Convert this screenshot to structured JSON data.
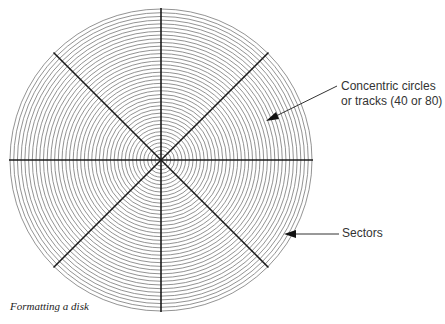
{
  "diagram": {
    "title": "Formatting a disk",
    "disk": {
      "center": [
        161,
        160
      ],
      "outer_radius": 151,
      "inner_radius": 6,
      "track_count": 40,
      "sector_lines": 8,
      "track_color": "#777777",
      "sector_color": "#1a1a1a"
    },
    "labels": {
      "tracks_line1": "Concentric circles",
      "tracks_line2": "or tracks (40 or 80)",
      "sectors": "Sectors"
    },
    "caption": "Formatting a disk"
  }
}
